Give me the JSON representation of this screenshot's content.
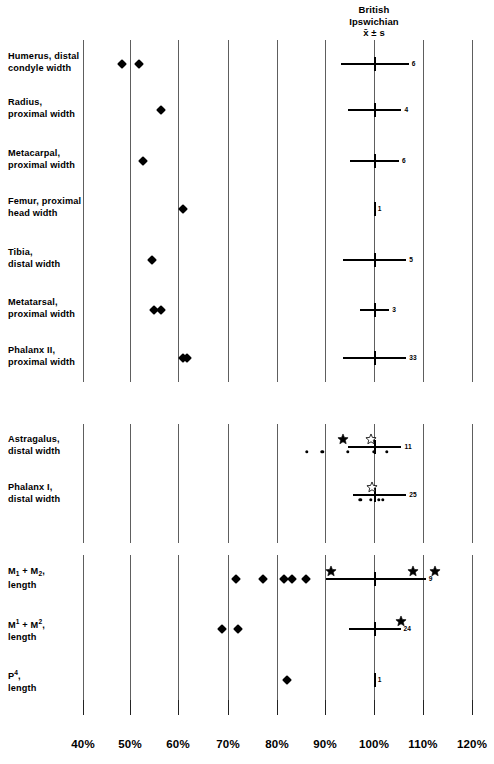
{
  "header": {
    "line1": "British",
    "line2": "Ipswichian",
    "line3": "x̄ ± s"
  },
  "axis": {
    "ticklabels": [
      "40%",
      "50%",
      "60%",
      "70%",
      "80%",
      "90%",
      "100%",
      "110%",
      "120%"
    ],
    "tickvalues": [
      40,
      50,
      60,
      70,
      80,
      90,
      100,
      110,
      120
    ],
    "tick_x": [
      83,
      130,
      178,
      228,
      277,
      325,
      374,
      423,
      472
    ]
  },
  "groups": [
    {
      "id": "postcranial-limb",
      "rows": [
        {
          "label_line1": "Humerus, distal",
          "label_line2": "condyle  width",
          "n": "6"
        },
        {
          "label_line1": "Radius,",
          "label_line2": "proximal  width",
          "n": "4"
        },
        {
          "label_line1": "Metacarpal,",
          "label_line2": "proximal  width",
          "n": "6"
        },
        {
          "label_line1": "Femur, proximal",
          "label_line2": "head  width",
          "n": "1"
        },
        {
          "label_line1": "Tibia,",
          "label_line2": "distal  width",
          "n": "5"
        },
        {
          "label_line1": "Metatarsal,",
          "label_line2": "proximal  width",
          "n": "3"
        },
        {
          "label_line1": "Phalanx  II,",
          "label_line2": "proximal  width",
          "n": "33"
        }
      ]
    },
    {
      "id": "astragalus-phalanx",
      "rows": [
        {
          "label_line1": "Astragalus,",
          "label_line2": "distal width",
          "n": "11"
        },
        {
          "label_line1": "Phalanx I,",
          "label_line2": "distal width",
          "n": "25"
        }
      ]
    },
    {
      "id": "teeth",
      "rows": [
        {
          "label_html": "M<sub>1</sub> + M<sub>2</sub>,",
          "label_line2": "length",
          "n": "9"
        },
        {
          "label_html": "M<sup>1</sup> + M<sup>2</sup>,",
          "label_line2": "length",
          "n": "24"
        },
        {
          "label_html": "P<sup>4</sup>,",
          "label_line2": "length",
          "n": "1"
        }
      ]
    }
  ],
  "chart_data": {
    "type": "scatter",
    "xlabel": "",
    "ylabel": "",
    "xlim": [
      38,
      122
    ],
    "xunit": "percent",
    "grid": "vertical gridlines at every 10% tick, broken into three row-groups",
    "reference_line": 100,
    "legend": [
      {
        "marker": "diamond",
        "meaning": "filled diamond sample"
      },
      {
        "marker": "filled-star",
        "meaning": "filled star sample"
      },
      {
        "marker": "open-star",
        "meaning": "open star sample"
      },
      {
        "marker": "dot",
        "meaning": "small dot sample"
      },
      {
        "marker": "errorbar",
        "meaning": "British Ipswichian mean ± s, number = n"
      }
    ],
    "series": [
      {
        "name": "Humerus, distal condyle width",
        "group": 1,
        "mean": 100.0,
        "sd_low": 93.0,
        "sd_high": 107.0,
        "n": 6,
        "points": [
          {
            "marker": "diamond",
            "x": 48.0
          },
          {
            "marker": "diamond",
            "x": 51.5
          }
        ]
      },
      {
        "name": "Radius, proximal width",
        "group": 1,
        "mean": 100.0,
        "sd_low": 94.5,
        "sd_high": 105.5,
        "n": 4,
        "points": [
          {
            "marker": "diamond",
            "x": 56.0
          }
        ]
      },
      {
        "name": "Metacarpal, proximal width",
        "group": 1,
        "mean": 100.0,
        "sd_low": 95.0,
        "sd_high": 105.0,
        "n": 6,
        "points": [
          {
            "marker": "diamond",
            "x": 52.3
          }
        ]
      },
      {
        "name": "Femur, proximal head width",
        "group": 1,
        "mean": 100.0,
        "sd_low": 100.0,
        "sd_high": 100.0,
        "n": 1,
        "points": [
          {
            "marker": "diamond",
            "x": 60.5
          }
        ]
      },
      {
        "name": "Tibia, distal width",
        "group": 1,
        "mean": 100.0,
        "sd_low": 93.5,
        "sd_high": 106.5,
        "n": 5,
        "points": [
          {
            "marker": "diamond",
            "x": 54.2
          }
        ]
      },
      {
        "name": "Metatarsal, proximal width",
        "group": 1,
        "mean": 100.0,
        "sd_low": 97.0,
        "sd_high": 103.0,
        "n": 3,
        "points": [
          {
            "marker": "diamond",
            "x": 54.7
          },
          {
            "marker": "diamond",
            "x": 56.0
          }
        ]
      },
      {
        "name": "Phalanx II, proximal width",
        "group": 1,
        "mean": 100.0,
        "sd_low": 93.5,
        "sd_high": 106.5,
        "n": 33,
        "points": [
          {
            "marker": "diamond",
            "x": 60.6
          },
          {
            "marker": "diamond",
            "x": 61.4
          }
        ]
      },
      {
        "name": "Astragalus, distal width",
        "group": 2,
        "mean": 100.0,
        "sd_low": 94.5,
        "sd_high": 105.5,
        "n": 11,
        "points": [
          {
            "marker": "dot",
            "x": 86.0
          },
          {
            "marker": "dot",
            "x": 89.2
          },
          {
            "marker": "dot",
            "x": 94.5
          },
          {
            "marker": "dot",
            "x": 99.8
          },
          {
            "marker": "dot",
            "x": 102.5
          },
          {
            "marker": "filled-star",
            "x": 93.5
          },
          {
            "marker": "open-star",
            "x": 99.2
          }
        ]
      },
      {
        "name": "Phalanx I, distal width",
        "group": 2,
        "mean": 100.0,
        "sd_low": 95.5,
        "sd_high": 106.5,
        "n": 25,
        "points": [
          {
            "marker": "dot",
            "x": 97.0
          },
          {
            "marker": "dot",
            "x": 99.2
          },
          {
            "marker": "dot",
            "x": 100.8
          },
          {
            "marker": "dot",
            "x": 101.6
          },
          {
            "marker": "open-star",
            "x": 99.4
          }
        ]
      },
      {
        "name": "M1 + M2, length",
        "group": 3,
        "mean": 100.0,
        "sd_low": 90.0,
        "sd_high": 110.5,
        "n": 9,
        "points": [
          {
            "marker": "diamond",
            "x": 71.5
          },
          {
            "marker": "diamond",
            "x": 77.0
          },
          {
            "marker": "diamond",
            "x": 81.3
          },
          {
            "marker": "diamond",
            "x": 82.9
          },
          {
            "marker": "diamond",
            "x": 85.8
          },
          {
            "marker": "filled-star",
            "x": 91.0
          },
          {
            "marker": "filled-star",
            "x": 107.8
          },
          {
            "marker": "filled-star",
            "x": 112.3
          }
        ]
      },
      {
        "name": "M1 + M2 (upper), length",
        "group": 3,
        "mean": 100.0,
        "sd_low": 94.7,
        "sd_high": 105.3,
        "n": 24,
        "points": [
          {
            "marker": "diamond",
            "x": 68.5
          },
          {
            "marker": "diamond",
            "x": 71.8
          },
          {
            "marker": "filled-star",
            "x": 105.3
          }
        ]
      },
      {
        "name": "P4, length",
        "group": 3,
        "mean": 100.0,
        "sd_low": 100.0,
        "sd_high": 100.0,
        "n": 1,
        "points": [
          {
            "marker": "diamond",
            "x": 82.0
          }
        ]
      }
    ]
  }
}
